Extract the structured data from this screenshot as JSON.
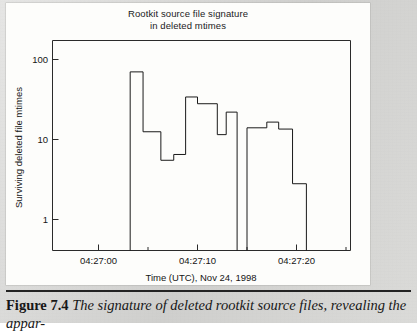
{
  "figure": {
    "caption_label": "Figure 7.4",
    "caption_text": "The signature of deleted rootkit source files, revealing the appar-"
  },
  "chart_data": {
    "type": "line",
    "subtype": "step-histogram",
    "title": "Rootkit source file signature\nin deleted mtimes",
    "title_line1": "Rootkit source file signature",
    "title_line2": "in deleted mtimes",
    "xlabel": "Time (UTC), Nov 24, 1998",
    "ylabel": "Surviving deleted file mtimes",
    "yscale": "log",
    "ylim": [
      0.6,
      220
    ],
    "ytick_values": [
      1,
      10,
      100
    ],
    "ytick_labels": [
      "1",
      "10",
      "100"
    ],
    "xlim_seconds": [
      -4.5,
      25.5
    ],
    "xtick_values": [
      0,
      10,
      20
    ],
    "xtick_labels": [
      "04:27:00",
      "04:27:10",
      "04:27:20"
    ],
    "xtick_minor_values": [
      5,
      15,
      25
    ],
    "grid": false,
    "legend": false,
    "line_color": "#1a1a1a",
    "background": "#fdfdfb",
    "x_unit": "seconds after 04:27:00",
    "steps": [
      {
        "x_start": 3.2,
        "x_end": 4.5,
        "value": 70
      },
      {
        "x_start": 4.5,
        "x_end": 6.3,
        "value": 12.5
      },
      {
        "x_start": 6.3,
        "x_end": 7.6,
        "value": 5.5
      },
      {
        "x_start": 7.6,
        "x_end": 8.8,
        "value": 6.5
      },
      {
        "x_start": 8.8,
        "x_end": 10.0,
        "value": 34
      },
      {
        "x_start": 10.0,
        "x_end": 12.0,
        "value": 28
      },
      {
        "x_start": 12.0,
        "x_end": 12.9,
        "value": 11.5
      },
      {
        "x_start": 12.9,
        "x_end": 14.0,
        "value": 22
      },
      {
        "x_start": 15.0,
        "x_end": 17.0,
        "value": 14
      },
      {
        "x_start": 17.0,
        "x_end": 18.2,
        "value": 16.5
      },
      {
        "x_start": 18.2,
        "x_end": 19.6,
        "value": 13.5
      },
      {
        "x_start": 19.6,
        "x_end": 21.0,
        "value": 2.8
      }
    ],
    "gap_between_clusters": {
      "from": 14.0,
      "to": 15.0
    }
  }
}
